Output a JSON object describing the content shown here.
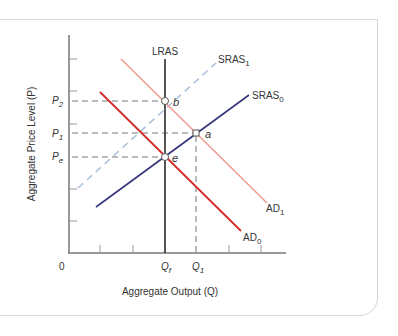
{
  "diagram": {
    "type": "AD-AS macroeconomic model",
    "y_axis_label": "Aggregate Price Level (P)",
    "x_axis_label": "Aggregate Output (Q)",
    "origin_label": "0",
    "price_levels": [
      {
        "base": "P",
        "sub": "2",
        "name": "P2"
      },
      {
        "base": "P",
        "sub": "1",
        "name": "P1"
      },
      {
        "base": "P",
        "sub": "e",
        "name": "Pe"
      }
    ],
    "output_levels": [
      {
        "base": "Q",
        "sub": "f",
        "name": "Qf"
      },
      {
        "base": "Q",
        "sub": "1",
        "name": "Q1"
      }
    ],
    "curves": [
      {
        "id": "LRAS",
        "label": "LRAS",
        "sub": "",
        "color": "#2b2b2b",
        "style": "solid"
      },
      {
        "id": "SRAS1",
        "label": "SRAS",
        "sub": "1",
        "color": "#a9bfdc",
        "style": "dashed"
      },
      {
        "id": "SRAS0",
        "label": "SRAS",
        "sub": "0",
        "color": "#35357a",
        "style": "solid"
      },
      {
        "id": "AD1",
        "label": "AD",
        "sub": "1",
        "color": "#ef9a8f",
        "style": "solid"
      },
      {
        "id": "AD0",
        "label": "AD",
        "sub": "0",
        "color": "#d42a27",
        "style": "solid"
      }
    ],
    "points": [
      {
        "label": "b"
      },
      {
        "label": "a"
      },
      {
        "label": "e"
      }
    ]
  }
}
